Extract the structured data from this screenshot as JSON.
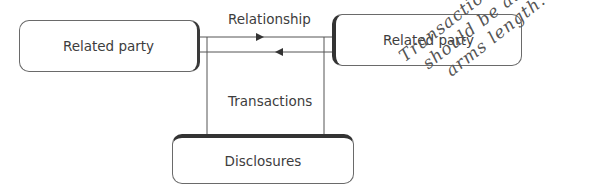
{
  "diagram": {
    "nodes": {
      "left_party": "Related party",
      "right_party": "Related party",
      "disclosures": "Disclosures"
    },
    "edges": {
      "relationship_label": "Relationship",
      "transactions_label": "Transactions"
    },
    "annotation": {
      "lines": [
        "Transactions",
        "should be at",
        "arms length."
      ]
    },
    "colors": {
      "line": "#555555",
      "box_border": "#6a6a6a",
      "shadow_edge": "#333333",
      "text": "#3d3d3d"
    }
  }
}
